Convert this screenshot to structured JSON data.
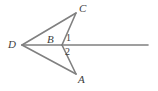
{
  "figure": {
    "background_color": "#ffffff",
    "stroke_color": "#808080",
    "label_color": "#3d3d3d",
    "stroke_width": 1.6,
    "width": 158,
    "height": 91,
    "points": {
      "A": {
        "label": "A",
        "x": 76,
        "y": 74
      },
      "B": {
        "label": "B",
        "x": 62,
        "y": 45
      },
      "C": {
        "label": "C",
        "x": 76,
        "y": 13
      },
      "D": {
        "label": "D",
        "x": 22,
        "y": 45
      }
    },
    "ray_end": {
      "x": 148,
      "y": 45
    },
    "segments": [
      {
        "name": "segment-DC",
        "x1": 22,
        "y1": 45,
        "x2": 76,
        "y2": 13
      },
      {
        "name": "segment-DB",
        "x1": 22,
        "y1": 45,
        "x2": 62,
        "y2": 45
      },
      {
        "name": "segment-DA",
        "x1": 22,
        "y1": 45,
        "x2": 76,
        "y2": 74
      },
      {
        "name": "segment-BC",
        "x1": 62,
        "y1": 45,
        "x2": 76,
        "y2": 13
      },
      {
        "name": "segment-BA",
        "x1": 62,
        "y1": 45,
        "x2": 76,
        "y2": 74
      },
      {
        "name": "ray-B-right",
        "x1": 62,
        "y1": 45,
        "x2": 148,
        "y2": 45
      }
    ],
    "angle_labels": [
      {
        "name": "angle-1",
        "text": "1"
      },
      {
        "name": "angle-2",
        "text": "2"
      }
    ]
  }
}
